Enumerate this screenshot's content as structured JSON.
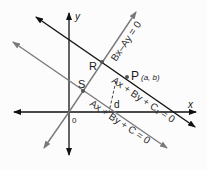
{
  "diagram": {
    "axes": {
      "x_label": "x",
      "y_label": "y",
      "origin_label": "0"
    },
    "points": {
      "P": {
        "label": "P",
        "coords": "(a, b)"
      },
      "R": {
        "label": "R"
      },
      "S": {
        "label": "S"
      }
    },
    "distance_label": "d",
    "lines": [
      {
        "id": "perpendicular",
        "equation": "Bx–Ay = 0",
        "color": "#777777"
      },
      {
        "id": "line-through-P",
        "equation": "Ax + By + C₁ = 0",
        "color": "#111111"
      },
      {
        "id": "base-line",
        "equation": "Ax + By + C = 0",
        "color": "#777777"
      }
    ],
    "colors": {
      "axis": "#111111",
      "gray_line": "#7a7a7a",
      "point": "#555555"
    }
  }
}
